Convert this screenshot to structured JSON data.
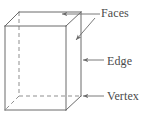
{
  "diagram": {
    "shape_name": "rectangular-prism",
    "stroke_color": "#6b6b6b",
    "hidden_stroke_color": "#8a8a8a",
    "text_color": "#4a4a4a",
    "background_color": "#ffffff",
    "labels": [
      {
        "id": "faces",
        "text": "Faces",
        "points_to": [
          "top-face",
          "right-face"
        ]
      },
      {
        "id": "edge",
        "text": "Edge",
        "points_to": [
          "back-right-vertical-edge"
        ]
      },
      {
        "id": "vertex",
        "text": "Vertex",
        "points_to": [
          "back-bottom-right-vertex"
        ]
      }
    ],
    "geometry": {
      "front_top_left": [
        5,
        26
      ],
      "front_top_right": [
        66,
        26
      ],
      "front_bottom_left": [
        5,
        110
      ],
      "front_bottom_right": [
        66,
        110
      ],
      "back_top_left": [
        19,
        12
      ],
      "back_top_right": [
        81,
        12
      ],
      "back_bottom_left": [
        19,
        96
      ],
      "back_bottom_right": [
        81,
        96
      ],
      "hidden_edges": [
        "back_top_left-back_bottom_left",
        "back_bottom_left-front_bottom_left",
        "back_bottom_left-back_bottom_right"
      ]
    }
  }
}
